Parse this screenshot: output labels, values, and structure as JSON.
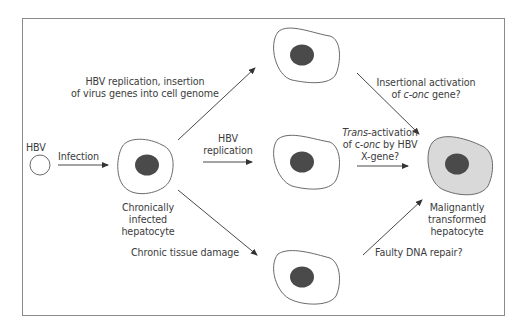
{
  "diagram": {
    "type": "flow",
    "colors": {
      "border": "#8a8a8a",
      "cell_outline": "#6a6a6a",
      "nucleus": "#4a4a4a",
      "malignant_fill": "#d9d9d9",
      "arrow": "#333333",
      "text": "#3c3c3c"
    },
    "nodes": {
      "hbv": {
        "label": "HBV"
      },
      "chronic_cell": {
        "label_lines": [
          "Chronically",
          "infected",
          "hepatocyte"
        ]
      },
      "top_cell": {
        "label": ""
      },
      "middle_cell": {
        "label": ""
      },
      "bottom_cell": {
        "label": ""
      },
      "malignant_cell": {
        "label_lines": [
          "Malignantly",
          "transformed",
          "hepatocyte"
        ]
      }
    },
    "edges": {
      "infection": {
        "label": "Infection"
      },
      "to_top": {
        "label_lines": [
          "HBV replication, insertion",
          "of virus genes into cell genome"
        ]
      },
      "to_middle": {
        "label_lines": [
          "HBV",
          "replication"
        ]
      },
      "to_bottom": {
        "label": "Chronic tissue damage"
      },
      "top_to_malignant": {
        "line1": "Insertional activation",
        "line2_prefix": "of ",
        "line2_italic": "c-onc",
        "line2_suffix": " gene?"
      },
      "middle_to_malignant": {
        "line1_italic": "Trans",
        "line1_suffix": "-activation",
        "line2_prefix": "of c-",
        "line2_italic": "onc",
        "line2_suffix": " by HBV",
        "line3": "X-gene?"
      },
      "bottom_to_malignant": {
        "label": "Faulty DNA repair?"
      }
    }
  }
}
